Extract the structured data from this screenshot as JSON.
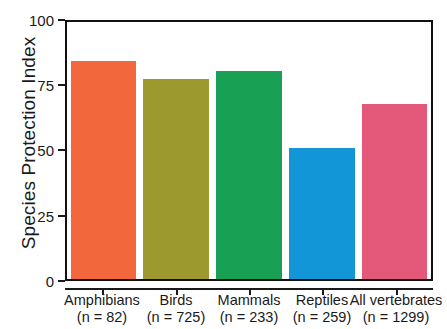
{
  "chart_data": {
    "type": "bar",
    "title": "",
    "xlabel": "",
    "ylabel": "Species Protection Index",
    "ylim": [
      0,
      100
    ],
    "yticks": [
      0,
      25,
      50,
      75,
      100
    ],
    "ytick_labels": [
      "0",
      "25",
      "50",
      "75",
      "100"
    ],
    "grid": false,
    "legend": "none",
    "categories": [
      "Amphibians",
      "Birds",
      "Mammals",
      "Reptiles",
      "All vertebrates"
    ],
    "sample_size_labels": [
      "(n = 82)",
      "(n = 725)",
      "(n = 233)",
      "(n = 259)",
      "(n = 1299)"
    ],
    "sample_sizes": [
      82,
      725,
      233,
      259,
      1299
    ],
    "values": [
      85,
      78,
      81,
      51,
      68
    ],
    "colors": [
      "#F2683C",
      "#9C9A2E",
      "#18A054",
      "#1296D8",
      "#E4587A"
    ],
    "bars": [
      {
        "category": "Amphibians",
        "n_label": "(n = 82)",
        "value": 85,
        "color": "#F2683C"
      },
      {
        "category": "Birds",
        "n_label": "(n = 725)",
        "value": 78,
        "color": "#9C9A2E"
      },
      {
        "category": "Mammals",
        "n_label": "(n = 233)",
        "value": 81,
        "color": "#18A054"
      },
      {
        "category": "Reptiles",
        "n_label": "(n = 259)",
        "value": 51,
        "color": "#1296D8"
      },
      {
        "category": "All vertebrates",
        "n_label": "(n = 1299)",
        "value": 68,
        "color": "#E4587A"
      }
    ]
  },
  "axis": {
    "y_title": "Species Protection Index",
    "y_tick_0": "0",
    "y_tick_25": "25",
    "y_tick_50": "50",
    "y_tick_75": "75",
    "y_tick_100": "100"
  },
  "labels": {
    "cat_0": "Amphibians",
    "cat_1": "Birds",
    "cat_2": "Mammals",
    "cat_3": "Reptiles",
    "cat_4": "All vertebrates",
    "n_0": "(n = 82)",
    "n_1": "(n = 725)",
    "n_2": "(n = 233)",
    "n_3": "(n = 259)",
    "n_4": "(n = 1299)"
  }
}
